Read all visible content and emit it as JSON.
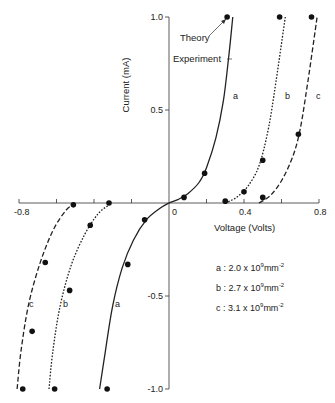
{
  "chart_data": {
    "type": "line",
    "title": "",
    "xlabel": "Voltage (Volts)",
    "ylabel": "Current (mA)",
    "xlim": [
      -0.8,
      0.8
    ],
    "ylim": [
      -1.0,
      1.0
    ],
    "x_ticks": [
      -0.8,
      -0.6,
      -0.4,
      -0.2,
      0,
      0.2,
      0.4,
      0.6,
      0.8
    ],
    "x_tick_labels": [
      "-0.8",
      "0",
      "0.4",
      "0.8"
    ],
    "y_ticks": [
      1.0,
      0.5,
      -0.5,
      -1.0
    ],
    "y_tick_labels": [
      "1.0",
      "0.5",
      "-0.5",
      "-1.0"
    ],
    "grid": false,
    "annotations": [
      "Theory",
      "Experiment"
    ],
    "series": [
      {
        "name": "a",
        "label": "a : 2.0 x 10^9 mm^-2",
        "line_style": "solid",
        "experiment_curve": [
          [
            -0.37,
            -1.0
          ],
          [
            -0.34,
            -0.8
          ],
          [
            -0.3,
            -0.55
          ],
          [
            -0.25,
            -0.35
          ],
          [
            -0.19,
            -0.2
          ],
          [
            -0.12,
            -0.09
          ],
          [
            -0.05,
            -0.03
          ],
          [
            0,
            0
          ],
          [
            0.05,
            0.02
          ],
          [
            0.1,
            0.05
          ],
          [
            0.16,
            0.11
          ],
          [
            0.2,
            0.19
          ],
          [
            0.25,
            0.35
          ],
          [
            0.29,
            0.55
          ],
          [
            0.32,
            0.8
          ],
          [
            0.34,
            1.0
          ]
        ],
        "theory_points": [
          [
            -0.33,
            -1.0
          ],
          [
            -0.22,
            -0.33
          ],
          [
            -0.13,
            -0.09
          ],
          [
            0.08,
            0.03
          ],
          [
            0.19,
            0.16
          ],
          [
            0.31,
            1.0
          ]
        ]
      },
      {
        "name": "b",
        "label": "b : 2.7 x 10^9 mm^-2",
        "line_style": "dotted",
        "experiment_curve": [
          [
            -0.64,
            -1.0
          ],
          [
            -0.62,
            -0.8
          ],
          [
            -0.58,
            -0.55
          ],
          [
            -0.52,
            -0.33
          ],
          [
            -0.45,
            -0.17
          ],
          [
            -0.38,
            -0.06
          ],
          [
            -0.32,
            -0.01
          ],
          [
            0.3,
            0.0
          ],
          [
            0.36,
            0.03
          ],
          [
            0.42,
            0.09
          ],
          [
            0.48,
            0.2
          ],
          [
            0.53,
            0.4
          ],
          [
            0.57,
            0.65
          ],
          [
            0.62,
            1.0
          ]
        ],
        "theory_points": [
          [
            -0.61,
            -1.0
          ],
          [
            -0.53,
            -0.47
          ],
          [
            -0.42,
            -0.12
          ],
          [
            -0.32,
            0.0
          ],
          [
            0.3,
            0.01
          ],
          [
            0.4,
            0.06
          ],
          [
            0.5,
            0.23
          ],
          [
            0.59,
            1.0
          ]
        ]
      },
      {
        "name": "c",
        "label": "c : 3.1 x 10^9 mm^-2",
        "line_style": "dashed",
        "experiment_curve": [
          [
            -0.81,
            -1.0
          ],
          [
            -0.79,
            -0.8
          ],
          [
            -0.75,
            -0.55
          ],
          [
            -0.69,
            -0.33
          ],
          [
            -0.62,
            -0.15
          ],
          [
            -0.55,
            -0.04
          ],
          [
            -0.51,
            -0.01
          ],
          [
            0.48,
            0.0
          ],
          [
            0.54,
            0.04
          ],
          [
            0.6,
            0.12
          ],
          [
            0.66,
            0.25
          ],
          [
            0.7,
            0.4
          ],
          [
            0.74,
            0.65
          ],
          [
            0.79,
            1.0
          ]
        ],
        "theory_points": [
          [
            -0.78,
            -1.0
          ],
          [
            -0.73,
            -0.69
          ],
          [
            -0.66,
            -0.32
          ],
          [
            -0.51,
            -0.01
          ],
          [
            0.5,
            0.03
          ],
          [
            0.69,
            0.37
          ],
          [
            0.76,
            1.0
          ]
        ]
      }
    ]
  },
  "axes": {
    "xlabel": "Voltage (Volts)",
    "ylabel": "Current (mA)",
    "x_tick_labels": [
      {
        "v": -0.8,
        "t": "-0.8"
      },
      {
        "v": 0,
        "t": "0"
      },
      {
        "v": 0.4,
        "t": "0.4"
      },
      {
        "v": 0.8,
        "t": "0.8"
      }
    ],
    "y_tick_labels": [
      {
        "v": 1.0,
        "t": "1.0"
      },
      {
        "v": 0.5,
        "t": "0.5"
      },
      {
        "v": -0.5,
        "t": "-0.5"
      },
      {
        "v": -1.0,
        "t": "-1.0"
      }
    ]
  },
  "annotations": {
    "theory": "Theory",
    "experiment": "Experiment"
  },
  "legend": [
    {
      "key": "a",
      "text": "a : 2.0 x 10",
      "exp1": "9",
      "unit": "mm",
      "exp2": "-2"
    },
    {
      "key": "b",
      "text": "b : 2.7 x 10",
      "exp1": "9",
      "unit": "mm",
      "exp2": "-2"
    },
    {
      "key": "c",
      "text": "c : 3.1 x 10",
      "exp1": "9",
      "unit": "mm",
      "exp2": "-2"
    }
  ]
}
